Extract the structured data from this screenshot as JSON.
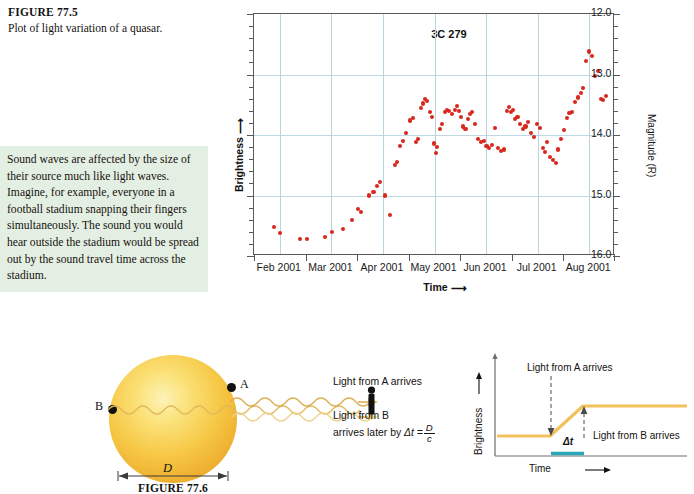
{
  "figure_caption": {
    "label": "FIGURE 77.5",
    "text": "Plot of light variation of a quasar."
  },
  "note": {
    "text": "Sound waves are affected by the size of their source much like light waves. Imagine, for example, everyone in a football stadium snapping their fingers simultaneously. The sound you would hear outside the stadium would be spread out by the sound travel time across the stadium.",
    "background_color": "#e4efe3"
  },
  "chart_data": {
    "type": "scatter",
    "title": "3C 279",
    "xlabel": "Time",
    "ylabel_left": "Brightness",
    "ylabel_right": "Magnitude (R)",
    "marker_color": "#d8281d",
    "grid": true,
    "legend": "none",
    "x_tick_labels": [
      "Feb 2001",
      "Mar 2001",
      "Apr 2001",
      "May 2001",
      "Jun 2001",
      "Jul 2001",
      "Aug 2001"
    ],
    "y_tick_labels": [
      "12.0",
      "13.0",
      "14.0",
      "15.0",
      "16.0"
    ],
    "ylim": [
      12.0,
      16.0
    ],
    "y_inverted": true,
    "xlim": [
      "2001-01-15",
      "2001-08-15"
    ],
    "points": [
      [
        0.055,
        15.52
      ],
      [
        0.072,
        15.62
      ],
      [
        0.128,
        15.72
      ],
      [
        0.147,
        15.72
      ],
      [
        0.196,
        15.68
      ],
      [
        0.215,
        15.6
      ],
      [
        0.246,
        15.56
      ],
      [
        0.272,
        15.4
      ],
      [
        0.289,
        15.22
      ],
      [
        0.296,
        15.28
      ],
      [
        0.318,
        15.0
      ],
      [
        0.331,
        14.94
      ],
      [
        0.34,
        14.84
      ],
      [
        0.349,
        14.78
      ],
      [
        0.362,
        15.0
      ],
      [
        0.377,
        15.32
      ],
      [
        0.39,
        14.5
      ],
      [
        0.396,
        14.44
      ],
      [
        0.404,
        14.18
      ],
      [
        0.413,
        14.1
      ],
      [
        0.42,
        13.96
      ],
      [
        0.432,
        13.76
      ],
      [
        0.441,
        13.72
      ],
      [
        0.449,
        14.12
      ],
      [
        0.455,
        14.06
      ],
      [
        0.462,
        13.56
      ],
      [
        0.468,
        13.48
      ],
      [
        0.474,
        13.4
      ],
      [
        0.48,
        13.44
      ],
      [
        0.487,
        13.62
      ],
      [
        0.494,
        13.7
      ],
      [
        0.498,
        14.14
      ],
      [
        0.503,
        14.3
      ],
      [
        0.508,
        14.2
      ],
      [
        0.514,
        13.9
      ],
      [
        0.52,
        13.82
      ],
      [
        0.528,
        13.62
      ],
      [
        0.534,
        13.58
      ],
      [
        0.54,
        13.6
      ],
      [
        0.548,
        13.66
      ],
      [
        0.556,
        13.58
      ],
      [
        0.562,
        13.52
      ],
      [
        0.568,
        13.6
      ],
      [
        0.574,
        13.7
      ],
      [
        0.58,
        13.86
      ],
      [
        0.586,
        13.9
      ],
      [
        0.592,
        13.74
      ],
      [
        0.598,
        13.66
      ],
      [
        0.604,
        13.62
      ],
      [
        0.612,
        13.82
      ],
      [
        0.62,
        14.06
      ],
      [
        0.628,
        14.12
      ],
      [
        0.636,
        14.1
      ],
      [
        0.644,
        14.18
      ],
      [
        0.652,
        14.22
      ],
      [
        0.66,
        14.16
      ],
      [
        0.668,
        13.88
      ],
      [
        0.676,
        14.22
      ],
      [
        0.684,
        14.26
      ],
      [
        0.692,
        14.24
      ],
      [
        0.7,
        13.6
      ],
      [
        0.706,
        13.54
      ],
      [
        0.712,
        13.62
      ],
      [
        0.718,
        13.58
      ],
      [
        0.724,
        13.74
      ],
      [
        0.73,
        13.7
      ],
      [
        0.738,
        13.82
      ],
      [
        0.746,
        13.9
      ],
      [
        0.752,
        13.86
      ],
      [
        0.76,
        13.78
      ],
      [
        0.768,
        13.96
      ],
      [
        0.776,
        14.04
      ],
      [
        0.784,
        13.82
      ],
      [
        0.792,
        13.88
      ],
      [
        0.8,
        14.22
      ],
      [
        0.806,
        14.28
      ],
      [
        0.812,
        14.12
      ],
      [
        0.82,
        14.36
      ],
      [
        0.828,
        14.42
      ],
      [
        0.836,
        14.46
      ],
      [
        0.842,
        14.24
      ],
      [
        0.85,
        14.06
      ],
      [
        0.858,
        13.92
      ],
      [
        0.866,
        13.72
      ],
      [
        0.874,
        13.64
      ],
      [
        0.882,
        13.62
      ],
      [
        0.89,
        13.46
      ],
      [
        0.898,
        13.38
      ],
      [
        0.906,
        13.3
      ],
      [
        0.912,
        13.22
      ],
      [
        0.92,
        12.78
      ],
      [
        0.928,
        12.62
      ],
      [
        0.936,
        12.7
      ],
      [
        0.944,
        13.02
      ],
      [
        0.952,
        12.94
      ],
      [
        0.96,
        13.4
      ],
      [
        0.968,
        13.42
      ],
      [
        0.974,
        13.36
      ]
    ]
  },
  "figure_776": {
    "caption": "FIGURE 77.6",
    "point_a_label": "A",
    "point_b_label": "B",
    "diameter_label": "D",
    "annotation_a": "Light from A arrives",
    "annotation_b_line1": "Light from B",
    "annotation_b_line2": "arrives later by",
    "annotation_b_delta": "Δt  =",
    "fraction_numerator": "D",
    "fraction_denominator": "c",
    "star_color": "#f6c744"
  },
  "schematic": {
    "ylabel": "Brightness",
    "xlabel": "Time",
    "annotation_top": "Light from A arrives",
    "annotation_bottom": "Light from B arrives",
    "delta_label": "Δt",
    "curve_color": "#f2c15c",
    "delta_bar_color": "#2aa8b8"
  }
}
